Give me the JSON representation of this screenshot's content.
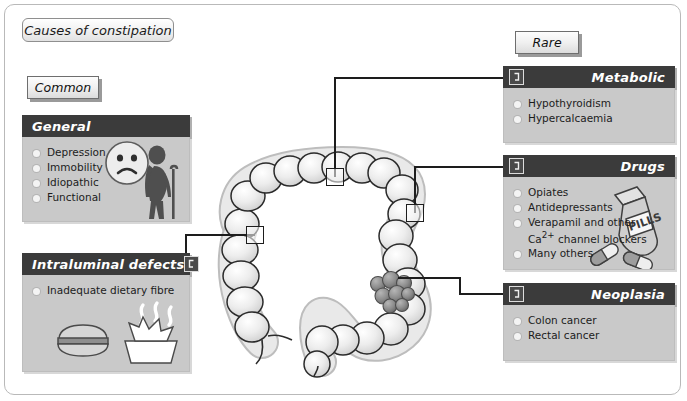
{
  "title": {
    "label": "Causes of constipation"
  },
  "legend": {
    "common_label": "Common",
    "rare_label": "Rare"
  },
  "panels": {
    "general": {
      "heading": "General",
      "items": [
        "Depression",
        "Immobility",
        "Idiopathic",
        "Functional"
      ],
      "icon": "connector-icon"
    },
    "intraluminal": {
      "heading": "Intraluminal defects",
      "items": [
        "Inadequate dietary fibre"
      ],
      "icon": "connector-icon"
    },
    "metabolic": {
      "heading": "Metabolic",
      "items": [
        "Hypothyroidism",
        "Hypercalcaemia"
      ],
      "icon": "connector-icon"
    },
    "drugs": {
      "heading": "Drugs",
      "items": [
        "Opiates",
        "Antidepressants",
        "Verapamil and other Ca2+ channel blockers",
        "Many others"
      ],
      "item3_line1": "Verapamil and other",
      "item3_line2_pre": "Ca",
      "item3_line2_sup": "2+",
      "item3_line2_post": " channel blockers",
      "pill_bottle_label": "PILLS",
      "icon": "connector-icon"
    },
    "neoplasia": {
      "heading": "Neoplasia",
      "items": [
        "Colon cancer",
        "Rectal cancer"
      ],
      "icon": "connector-icon"
    }
  },
  "diagram": {
    "name": "large-bowel-colon-diagram",
    "markers": [
      {
        "name": "marker-transverse-colon",
        "links_to": "metabolic"
      },
      {
        "name": "marker-descending-colon",
        "links_to": "drugs"
      },
      {
        "name": "marker-ascending-colon",
        "links_to": "intraluminal"
      },
      {
        "name": "marker-sigmoid-tumour",
        "links_to": "neoplasia"
      }
    ],
    "tumour_label": "colonic tumour mass"
  },
  "colors": {
    "header_bar": "#3b3b3b",
    "panel_body": "#c9c9c9",
    "frame_border": "#b9b9b9",
    "line": "#1d1d1d",
    "bullet": "#f4f4f4",
    "bowel_fill": "#e9e9e9",
    "tumour": "#8d8d8d"
  }
}
